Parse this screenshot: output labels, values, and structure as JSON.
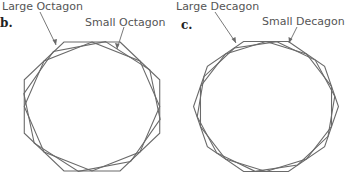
{
  "panels": [
    {
      "letter": "b.",
      "label_large": "Large Octagon",
      "label_small": "Small Octagon",
      "sides": 8
    },
    {
      "letter": "c.",
      "label_large": "Large Decagon",
      "label_small": "Small Decagon",
      "sides": 10
    }
  ],
  "colors": {
    "stroke": "#6a6a6a",
    "text": "#555555",
    "letter": "#222222"
  }
}
